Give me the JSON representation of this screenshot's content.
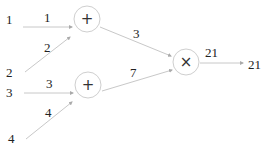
{
  "diagram": {
    "type": "computational-graph",
    "inputs": [
      {
        "id": "in1",
        "label": "1"
      },
      {
        "id": "in2",
        "label": "2"
      },
      {
        "id": "in3",
        "label": "3"
      },
      {
        "id": "in4",
        "label": "4"
      }
    ],
    "nodes": [
      {
        "id": "add1",
        "op": "+"
      },
      {
        "id": "add2",
        "op": "+"
      },
      {
        "id": "mul",
        "op": "×"
      }
    ],
    "edges": [
      {
        "from": "in1",
        "to": "add1",
        "label": "1"
      },
      {
        "from": "in2",
        "to": "add1",
        "label": "2"
      },
      {
        "from": "in3",
        "to": "add2",
        "label": "3"
      },
      {
        "from": "in4",
        "to": "add2",
        "label": "4"
      },
      {
        "from": "add1",
        "to": "mul",
        "label": "3"
      },
      {
        "from": "add2",
        "to": "mul",
        "label": "7"
      },
      {
        "from": "mul",
        "to": "out",
        "label": "21"
      }
    ],
    "output": {
      "id": "out",
      "label": "21"
    }
  },
  "colors": {
    "edge": "#c8c8c8",
    "node_border": "#cfcfcf",
    "text": "#222222"
  }
}
